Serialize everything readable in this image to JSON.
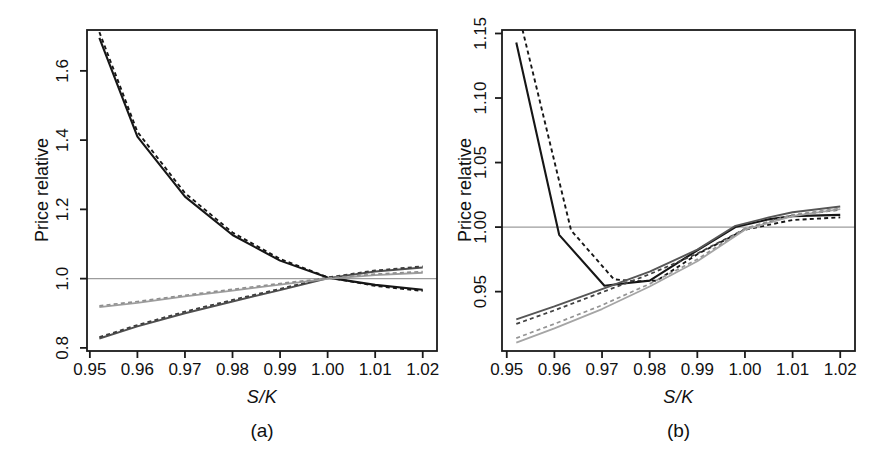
{
  "figure": {
    "background": "#ffffff",
    "axis_color": "#1a1a1a",
    "reference_line_color": "#9c9c9c",
    "tick_label_color": "#111111"
  },
  "chart_data": [
    {
      "id": "a",
      "type": "line",
      "caption": "(a)",
      "xlabel": "S/K",
      "ylabel": "Price relative",
      "grid": false,
      "legend": "none",
      "reference_line_y": 1.0,
      "x_domain": [
        0.9494,
        1.023
      ],
      "y_domain": [
        0.791,
        1.718
      ],
      "x_ticks": [
        0.95,
        0.96,
        0.97,
        0.98,
        0.99,
        1.0,
        1.01,
        1.02
      ],
      "x_tick_labels": [
        "0.95",
        "0.96",
        "0.97",
        "0.98",
        "0.99",
        "1.00",
        "1.01",
        "1.02"
      ],
      "y_ticks": [
        0.8,
        1.0,
        1.2,
        1.4,
        1.6
      ],
      "y_tick_labels": [
        "0.8",
        "1.0",
        "1.2",
        "1.4",
        "1.6"
      ],
      "series": [
        {
          "name": "black-solid",
          "color": "#161616",
          "style": "solid",
          "width": 2.1,
          "points": [
            [
              0.952,
              1.695
            ],
            [
              0.96,
              1.41
            ],
            [
              0.97,
              1.237
            ],
            [
              0.98,
              1.126
            ],
            [
              0.99,
              1.052
            ],
            [
              1.0,
              1.003
            ],
            [
              1.01,
              0.982
            ],
            [
              1.02,
              0.968
            ]
          ]
        },
        {
          "name": "black-dashed",
          "color": "#161616",
          "style": "dashed",
          "width": 1.9,
          "points": [
            [
              0.952,
              1.712
            ],
            [
              0.96,
              1.424
            ],
            [
              0.97,
              1.247
            ],
            [
              0.98,
              1.133
            ],
            [
              0.99,
              1.057
            ],
            [
              1.0,
              1.004
            ],
            [
              1.01,
              0.979
            ],
            [
              1.02,
              0.9645
            ]
          ]
        },
        {
          "name": "darkgray-solid",
          "color": "#4f4f4f",
          "style": "solid",
          "width": 1.9,
          "points": [
            [
              0.952,
              0.827
            ],
            [
              0.96,
              0.862
            ],
            [
              0.97,
              0.9
            ],
            [
              0.98,
              0.934
            ],
            [
              0.99,
              0.967
            ],
            [
              1.0,
              1.001
            ],
            [
              1.01,
              1.0205
            ],
            [
              1.02,
              1.032
            ]
          ]
        },
        {
          "name": "darkgray-dashed",
          "color": "#3d3d3d",
          "style": "dashed",
          "width": 1.8,
          "points": [
            [
              0.952,
              0.831
            ],
            [
              0.96,
              0.866
            ],
            [
              0.97,
              0.9045
            ],
            [
              0.98,
              0.9385
            ],
            [
              0.99,
              0.9705
            ],
            [
              1.0,
              1.0035
            ],
            [
              1.01,
              1.0235
            ],
            [
              1.02,
              1.0355
            ]
          ]
        },
        {
          "name": "lightgray-solid",
          "color": "#9d9d9d",
          "style": "solid",
          "width": 1.8,
          "points": [
            [
              0.952,
              0.918
            ],
            [
              0.96,
              0.93
            ],
            [
              0.97,
              0.9485
            ],
            [
              0.98,
              0.9655
            ],
            [
              0.99,
              0.9825
            ],
            [
              1.0,
              0.999
            ],
            [
              1.01,
              1.01
            ],
            [
              1.02,
              1.017
            ]
          ]
        },
        {
          "name": "lightgray-dashed",
          "color": "#8f8f8f",
          "style": "dashed",
          "width": 1.7,
          "points": [
            [
              0.952,
              0.9215
            ],
            [
              0.96,
              0.934
            ],
            [
              0.97,
              0.952
            ],
            [
              0.98,
              0.969
            ],
            [
              0.99,
              0.986
            ],
            [
              1.0,
              1.0015
            ],
            [
              1.01,
              1.013
            ],
            [
              1.02,
              1.0205
            ]
          ]
        }
      ]
    },
    {
      "id": "b",
      "type": "line",
      "caption": "(b)",
      "xlabel": "S/K",
      "ylabel": "Price relative",
      "grid": false,
      "legend": "none",
      "reference_line_y": 1.0,
      "x_domain": [
        0.949,
        1.0231
      ],
      "y_domain": [
        0.904,
        1.1527
      ],
      "x_ticks": [
        0.95,
        0.96,
        0.97,
        0.98,
        0.99,
        1.0,
        1.01,
        1.02
      ],
      "x_tick_labels": [
        "0.95",
        "0.96",
        "0.97",
        "0.98",
        "0.99",
        "1.00",
        "1.01",
        "1.02"
      ],
      "y_ticks": [
        0.95,
        1.0,
        1.05,
        1.1,
        1.15
      ],
      "y_tick_labels": [
        "0.95",
        "1.00",
        "1.05",
        "1.10",
        "1.15"
      ],
      "series": [
        {
          "name": "black-solid",
          "color": "#161616",
          "style": "solid",
          "width": 2.1,
          "points": [
            [
              0.952,
              1.143
            ],
            [
              0.961,
              0.994
            ],
            [
              0.9705,
              0.9545
            ],
            [
              0.975,
              0.9565
            ],
            [
              0.98,
              0.9585
            ],
            [
              0.99,
              0.982
            ],
            [
              0.998,
              1.0
            ],
            [
              1.005,
              1.006
            ],
            [
              1.01,
              1.0085
            ],
            [
              1.02,
              1.0095
            ]
          ]
        },
        {
          "name": "black-dashed",
          "color": "#161616",
          "style": "dashed",
          "width": 1.9,
          "points": [
            [
              0.9533,
              1.153
            ],
            [
              0.9635,
              0.9975
            ],
            [
              0.9725,
              0.9595
            ],
            [
              0.977,
              0.958
            ],
            [
              0.9815,
              0.9585
            ],
            [
              0.99,
              0.979
            ],
            [
              1.0,
              0.998
            ],
            [
              1.01,
              1.0055
            ],
            [
              1.02,
              1.0075
            ]
          ]
        },
        {
          "name": "darkgray-solid",
          "color": "#565656",
          "style": "solid",
          "width": 1.9,
          "points": [
            [
              0.952,
              0.9285
            ],
            [
              0.96,
              0.9385
            ],
            [
              0.97,
              0.952
            ],
            [
              0.98,
              0.9655
            ],
            [
              0.99,
              0.9825
            ],
            [
              0.998,
              1.001
            ],
            [
              1.005,
              1.0075
            ],
            [
              1.01,
              1.0115
            ],
            [
              1.02,
              1.016
            ]
          ]
        },
        {
          "name": "darkgray-dashed",
          "color": "#424242",
          "style": "dashed",
          "width": 1.8,
          "points": [
            [
              0.952,
              0.925
            ],
            [
              0.96,
              0.9355
            ],
            [
              0.97,
              0.9495
            ],
            [
              0.98,
              0.9635
            ],
            [
              0.99,
              0.9795
            ],
            [
              1.0,
              0.9985
            ],
            [
              1.01,
              1.009
            ],
            [
              1.02,
              1.0135
            ]
          ]
        },
        {
          "name": "lightgray-solid",
          "color": "#a5a5a5",
          "style": "solid",
          "width": 1.8,
          "points": [
            [
              0.952,
              0.9105
            ],
            [
              0.96,
              0.9215
            ],
            [
              0.97,
              0.9365
            ],
            [
              0.98,
              0.954
            ],
            [
              0.99,
              0.9735
            ],
            [
              1.0,
              0.998
            ],
            [
              1.01,
              1.0085
            ],
            [
              1.02,
              1.014
            ]
          ]
        },
        {
          "name": "lightgray-dashed",
          "color": "#949494",
          "style": "dashed",
          "width": 1.7,
          "points": [
            [
              0.952,
              0.914
            ],
            [
              0.96,
              0.925
            ],
            [
              0.97,
              0.9395
            ],
            [
              0.98,
              0.956
            ],
            [
              0.99,
              0.975
            ],
            [
              1.0,
              0.999
            ],
            [
              1.01,
              1.0095
            ],
            [
              1.02,
              1.0145
            ]
          ]
        }
      ]
    }
  ]
}
